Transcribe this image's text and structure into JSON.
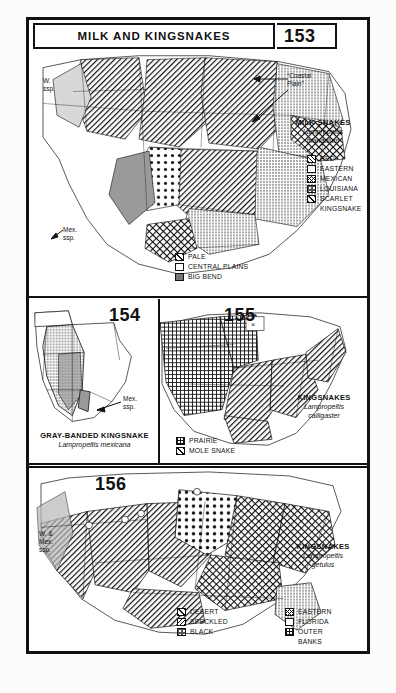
{
  "plate": {
    "title": "MILK AND KINGSNAKES",
    "numbers": {
      "p153": "153",
      "p154": "154",
      "p155": "155",
      "p156": "156"
    }
  },
  "panel_153": {
    "number": "153",
    "species_name": "MILK SNAKES",
    "scientific_name_line1": "Lampropeltis",
    "scientific_name_line2": "triangulum",
    "annotations": {
      "coastal_plain_line1": "“Coastal",
      "coastal_plain_line2": "Plain”",
      "west_ssp_line1": "W.",
      "west_ssp_line2": "ssp.",
      "mex_ssp_line1": "Mex.",
      "mex_ssp_line2": "ssp."
    },
    "legend_right": [
      {
        "label": "RED",
        "pattern": "diagonal-hatch"
      },
      {
        "label": "EASTERN",
        "pattern": "stipple"
      },
      {
        "label": "MEXICAN",
        "pattern": "cross-hatch"
      },
      {
        "label": "LOUISIANA",
        "pattern": "dark-dot"
      },
      {
        "label": "SCARLET",
        "pattern": "light-diagonal",
        "label2": "KINGSNAKE"
      }
    ],
    "legend_bottom": [
      {
        "label": "PALE",
        "pattern": "light-diagonal"
      },
      {
        "label": "CENTRAL PLAINS",
        "pattern": "stipple"
      },
      {
        "label": "BIG BEND",
        "pattern": "solid-gray"
      }
    ]
  },
  "panel_154": {
    "number": "154",
    "species_name": "GRAY-BANDED KINGSNAKE",
    "scientific_name": "Lampropeltis mexicana",
    "annotations": {
      "mex_ssp_line1": "Mex.",
      "mex_ssp_line2": "ssp."
    }
  },
  "panel_155": {
    "number": "155",
    "species_name": "KINGSNAKES",
    "scientific_name_line1": "Lampropeltis",
    "scientific_name_line2": "calligaster",
    "legend": [
      {
        "label": "PRAIRIE",
        "pattern": "grid"
      },
      {
        "label": "MOLE SNAKE",
        "pattern": "diagonal-hatch"
      }
    ]
  },
  "panel_156": {
    "number": "156",
    "species_name": "KINGSNAKES",
    "scientific_name_line1": "Lampropeltis",
    "scientific_name_line2": "getulus",
    "annotations": {
      "west_mex_ssp_line1": "W. &",
      "west_mex_ssp_line2": "Mex.",
      "west_mex_ssp_line3": "ssp."
    },
    "legend_left": [
      {
        "label": "DESERT",
        "pattern": "light-diagonal"
      },
      {
        "label": "SPECKLED",
        "pattern": "back-diagonal"
      },
      {
        "label": "BLACK",
        "pattern": "dark-dot"
      }
    ],
    "legend_right": [
      {
        "label": "EASTERN",
        "pattern": "cross-hatch"
      },
      {
        "label": "FLORIDA",
        "pattern": "stipple"
      },
      {
        "label": "OUTER",
        "pattern": "grid",
        "label2": "BANKS"
      }
    ]
  },
  "colors": {
    "ink": "#111111",
    "paper": "#ffffff",
    "page": "#fdfdfc",
    "gray_fill": "#9a9a9a"
  }
}
